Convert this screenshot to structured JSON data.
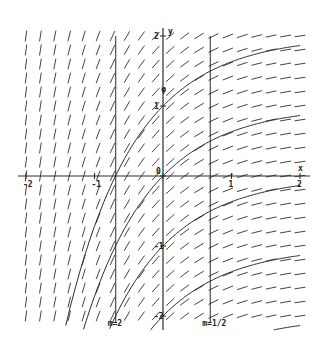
{
  "figure": {
    "axes": {
      "x_label": "x",
      "y_label": "y",
      "x_ticks": [
        {
          "value": -2,
          "label": "-2"
        },
        {
          "value": -1,
          "label": "-1"
        },
        {
          "value": 0,
          "label": "0"
        },
        {
          "value": 1,
          "label": "1"
        },
        {
          "value": 2,
          "label": "2"
        }
      ],
      "y_ticks": [
        {
          "value": 2,
          "label": "2"
        },
        {
          "value": 1,
          "label": "1"
        },
        {
          "value": 0,
          "label": "0"
        },
        {
          "value": -1,
          "label": "-1"
        },
        {
          "value": -2,
          "label": "-2"
        }
      ],
      "xlim": [
        -2.1,
        2.1
      ],
      "ylim": [
        -2.1,
        2.1
      ]
    },
    "isoclines": [
      {
        "x": -0.69,
        "label": "m=2"
      },
      {
        "x": 0.69,
        "label": "m=1/2"
      }
    ],
    "solution_constants": [
      2,
      1,
      0,
      -1,
      -2
    ],
    "extra_marks": [
      {
        "x": 0.15,
        "y": 1.2,
        "label": "φ"
      }
    ],
    "colors": {
      "ink": "#2a2a2a",
      "field": "#444444",
      "background": "#ffffff"
    }
  }
}
